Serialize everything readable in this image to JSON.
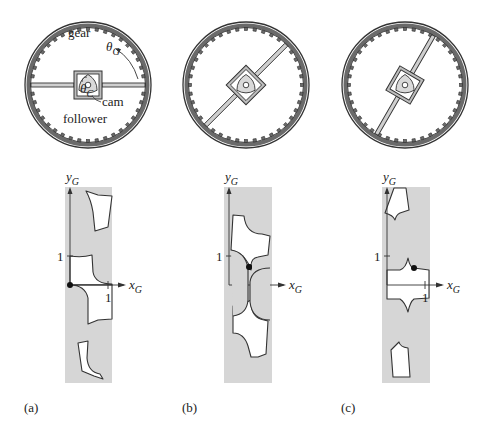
{
  "figure": {
    "colors": {
      "ink": "#333333",
      "gear_rim": "#6a6a6a",
      "cam_fill": "#d9d9d9",
      "cspace_fill": "#d6d6d6",
      "free_fill": "#ffffff",
      "dot": "#111111"
    },
    "gears": [
      {
        "id": "a",
        "cx": 88,
        "cy": 85,
        "r": 63,
        "teeth": 40,
        "follower_angle_deg": 0,
        "labels": {
          "gear": "gear",
          "theta_g": "θ",
          "theta_g_sub": "G",
          "theta_c": "θ",
          "theta_c_sub": "C",
          "cam": "cam",
          "follower": "follower"
        }
      },
      {
        "id": "b",
        "cx": 246,
        "cy": 85,
        "r": 63,
        "teeth": 40,
        "follower_angle_deg": -45
      },
      {
        "id": "c",
        "cx": 405,
        "cy": 85,
        "r": 63,
        "teeth": 40,
        "follower_angle_deg": -60
      }
    ],
    "cspaces": [
      {
        "id": "a",
        "strip": {
          "x": 65,
          "y": 187,
          "w": 47,
          "h": 196
        },
        "origin": {
          "x": 70,
          "y": 285
        },
        "y_tick_label": "1",
        "x_tick_label": "1",
        "x_axis_label": "x",
        "x_axis_sub": "G",
        "y_axis_label": "y",
        "y_axis_sub": "G",
        "dot": {
          "x": 70,
          "y": 285
        }
      },
      {
        "id": "b",
        "strip": {
          "x": 224,
          "y": 187,
          "w": 48,
          "h": 196
        },
        "origin": {
          "x": 229,
          "y": 285
        },
        "y_tick_label": "1",
        "x_tick_label": "1",
        "x_axis_label": "x",
        "x_axis_sub": "G",
        "y_axis_label": "y",
        "y_axis_sub": "G",
        "dot": {
          "x": 249,
          "y": 267
        }
      },
      {
        "id": "c",
        "strip": {
          "x": 382,
          "y": 187,
          "w": 48,
          "h": 196
        },
        "origin": {
          "x": 387,
          "y": 285
        },
        "y_tick_label": "1",
        "x_tick_label": "1",
        "x_axis_label": "x",
        "x_axis_sub": "G",
        "y_axis_label": "y",
        "y_axis_sub": "G",
        "dot": {
          "x": 414,
          "y": 268
        }
      }
    ],
    "panel_labels": [
      "(a)",
      "(b)",
      "(c)"
    ]
  }
}
